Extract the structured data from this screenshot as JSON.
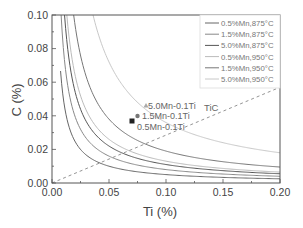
{
  "chart_data": {
    "type": "line",
    "title": "",
    "xlabel": "Ti (%)",
    "ylabel": "C (%)",
    "xlim": [
      0.0,
      0.2
    ],
    "ylim": [
      0.0,
      0.1
    ],
    "x_ticks": [
      "0.00",
      "0.05",
      "0.10",
      "0.15",
      "0.20"
    ],
    "y_ticks": [
      "0.00",
      "0.02",
      "0.04",
      "0.06",
      "0.08",
      "0.10"
    ],
    "grid": false,
    "legend_position": "upper right",
    "series": [
      {
        "name": "0.5%Mn,875°C",
        "type": "solubility-curve",
        "K": 0.0005,
        "color": "#666666",
        "x": [
          0.0075,
          0.01,
          0.02,
          0.05,
          0.1,
          0.15,
          0.2
        ],
        "values": [
          0.0667,
          0.05,
          0.025,
          0.01,
          0.005,
          0.0033,
          0.0025
        ]
      },
      {
        "name": "1.5%Mn,875°C",
        "type": "solubility-curve",
        "K": 0.0008,
        "color": "#888888",
        "x": [
          0.008,
          0.01,
          0.02,
          0.05,
          0.1,
          0.15,
          0.2
        ],
        "values": [
          0.1,
          0.08,
          0.04,
          0.016,
          0.008,
          0.0053,
          0.004
        ]
      },
      {
        "name": "5.0%Mn,875°C",
        "type": "solubility-curve",
        "K": 0.0011,
        "color": "#555555",
        "x": [
          0.011,
          0.02,
          0.05,
          0.1,
          0.15,
          0.2
        ],
        "values": [
          0.1,
          0.055,
          0.022,
          0.011,
          0.0073,
          0.0055
        ]
      },
      {
        "name": "0.5%Mn,950°C",
        "type": "solubility-curve",
        "K": 0.0013,
        "color": "#bbbbbb",
        "x": [
          0.013,
          0.02,
          0.05,
          0.1,
          0.15,
          0.2
        ],
        "values": [
          0.1,
          0.065,
          0.026,
          0.013,
          0.0087,
          0.0065
        ]
      },
      {
        "name": "1.5%Mn,950°C",
        "type": "solubility-curve",
        "K": 0.0019,
        "color": "#777777",
        "x": [
          0.019,
          0.05,
          0.1,
          0.15,
          0.2
        ],
        "values": [
          0.1,
          0.038,
          0.019,
          0.0127,
          0.0095
        ]
      },
      {
        "name": "5.0%Mn,950°C",
        "type": "solubility-curve",
        "K": 0.0036,
        "color": "#c8c8c8",
        "x": [
          0.036,
          0.05,
          0.1,
          0.15,
          0.2
        ],
        "values": [
          0.1,
          0.072,
          0.036,
          0.024,
          0.018
        ]
      },
      {
        "name": "TiC",
        "type": "stoichiometric-line",
        "dashed": true,
        "color": "#777777",
        "x": [
          0.0,
          0.2
        ],
        "values": [
          0.0,
          0.057
        ]
      }
    ],
    "points": [
      {
        "name": "0.5Mn-0.1Ti",
        "marker": "square",
        "x": 0.07,
        "y": 0.037,
        "color": "#222222"
      },
      {
        "name": "1.5Mn-0.1Ti",
        "marker": "circle",
        "x": 0.075,
        "y": 0.04,
        "color": "#777777"
      },
      {
        "name": "5.0Mn-0.1Ti",
        "marker": "triangle",
        "x": 0.082,
        "y": 0.046,
        "color": "#aaaaaa"
      }
    ],
    "annotations": [
      {
        "text": "TiC",
        "x": 0.167,
        "y": 0.043
      }
    ]
  },
  "labels": {
    "xlabel": "Ti (%)",
    "ylabel": "C (%)",
    "tic": "TiC",
    "p_square": "0.5Mn-0.1Ti",
    "p_circle": "1.5Mn-0.1Ti",
    "p_triangle": "5.0Mn-0.1Ti",
    "xt0": "0.00",
    "xt1": "0.05",
    "xt2": "0.10",
    "xt3": "0.15",
    "xt4": "0.20",
    "yt0": "0.00",
    "yt1": "0.02",
    "yt2": "0.04",
    "yt3": "0.06",
    "yt4": "0.08",
    "yt5": "0.10",
    "lg0": "0.5%Mn,875°C",
    "lg1": "1.5%Mn,875°C",
    "lg2": "5.0%Mn,875°C",
    "lg3": "0.5%Mn,950°C",
    "lg4": "1.5%Mn,950°C",
    "lg5": "5.0%Mn,950°C"
  }
}
